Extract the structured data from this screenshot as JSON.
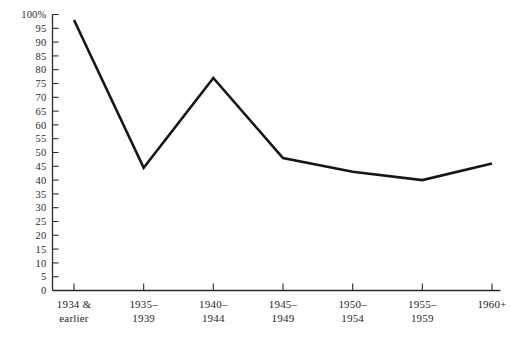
{
  "chart_data": {
    "type": "line",
    "title": "",
    "xlabel": "",
    "ylabel": "",
    "categories": [
      "1934 & earlier",
      "1935–1939",
      "1940–1944",
      "1945–1949",
      "1950–1954",
      "1955–1959",
      "1960+"
    ],
    "category_lines": [
      [
        "1934 &",
        "earlier"
      ],
      [
        "1935–",
        "1939"
      ],
      [
        "1940–",
        "1944"
      ],
      [
        "1945–",
        "1949"
      ],
      [
        "1950–",
        "1954"
      ],
      [
        "1955–",
        "1959"
      ],
      [
        "1960+",
        ""
      ]
    ],
    "values": [
      98,
      44.5,
      77,
      48,
      43,
      40,
      46
    ],
    "ylim": [
      0,
      100
    ],
    "ytick_step": 5,
    "ytick_labels": [
      "100%",
      "95",
      "90",
      "85",
      "80",
      "75",
      "70",
      "65",
      "60",
      "55",
      "50",
      "45",
      "40",
      "35",
      "30",
      "25",
      "20",
      "15",
      "10",
      "5",
      "0"
    ],
    "ytick_values": [
      100,
      95,
      90,
      85,
      80,
      75,
      70,
      65,
      60,
      55,
      50,
      45,
      40,
      35,
      30,
      25,
      20,
      15,
      10,
      5,
      0
    ],
    "grid": false,
    "legend": null,
    "legend_position": "none",
    "line_color": "#16161a",
    "axis_color": "#2a2a2a",
    "background_color": "#ffffff"
  },
  "figure": {
    "cropped_header_text": "",
    "units": "percent"
  }
}
